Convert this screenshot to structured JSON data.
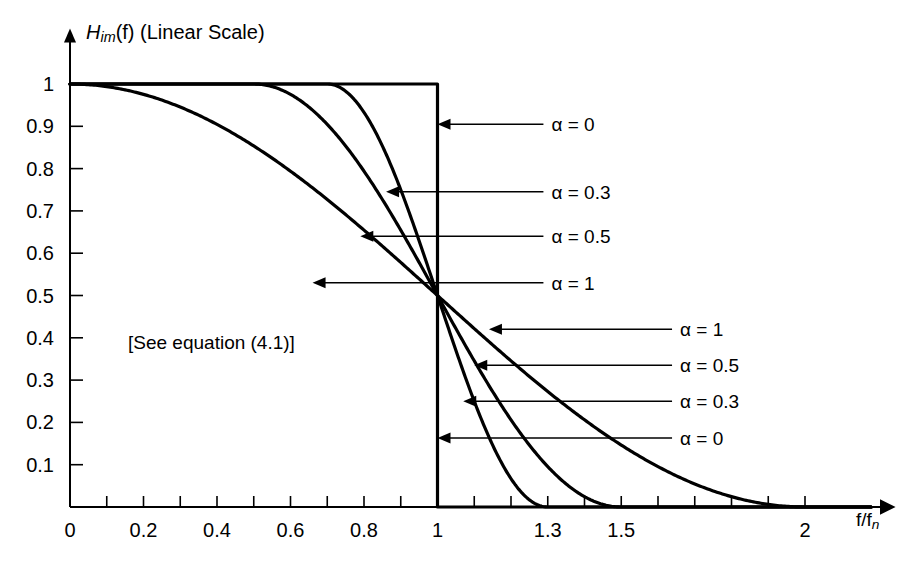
{
  "chart_data": {
    "type": "line",
    "title": "",
    "ylabel": "H_im(f) (Linear Scale)",
    "xlabel": "f/f_n",
    "xlim": [
      0,
      2.18
    ],
    "ylim": [
      0,
      1.06
    ],
    "grid": false,
    "legend_position": "inline-annotations",
    "annotation": "[See equation (4.1)]",
    "x_ticks_major": [
      0,
      0.2,
      0.4,
      0.6,
      0.8,
      1,
      1.3,
      1.5,
      2
    ],
    "x_tick_labels": [
      "0",
      "0.2",
      "0.4",
      "0.6",
      "0.8",
      "1",
      "1.3",
      "1.5",
      "2"
    ],
    "x_ticks_minor": [
      0.1,
      0.3,
      0.5,
      0.7,
      0.9,
      1.1,
      1.2,
      1.4,
      1.6,
      1.7,
      1.8,
      1.9
    ],
    "y_ticks": [
      0.1,
      0.2,
      0.3,
      0.4,
      0.5,
      0.6,
      0.7,
      0.8,
      0.9,
      1
    ],
    "y_tick_labels": [
      "0.1",
      "0.2",
      "0.3",
      "0.4",
      "0.5",
      "0.6",
      "0.7",
      "0.8",
      "0.9",
      "1"
    ],
    "crossing_point": [
      1,
      0.5
    ],
    "series": [
      {
        "name": "alpha = 0",
        "alpha": 0,
        "color": "#000000",
        "points": [
          [
            0,
            1
          ],
          [
            0.2,
            1
          ],
          [
            0.4,
            1
          ],
          [
            0.6,
            1
          ],
          [
            0.8,
            1
          ],
          [
            0.95,
            1
          ],
          [
            0.999,
            1
          ],
          [
            1,
            0.5
          ],
          [
            1.001,
            0
          ],
          [
            1.2,
            0
          ],
          [
            1.6,
            0
          ],
          [
            2,
            0
          ]
        ]
      },
      {
        "name": "alpha = 0.3",
        "alpha": 0.3,
        "color": "#000000",
        "points": [
          [
            0,
            1
          ],
          [
            0.3,
            1
          ],
          [
            0.5,
            1
          ],
          [
            0.65,
            1
          ],
          [
            0.7,
            1
          ],
          [
            0.75,
            0.983
          ],
          [
            0.8,
            0.9045
          ],
          [
            0.85,
            0.75
          ],
          [
            0.9,
            0.567
          ],
          [
            0.95,
            0.4131
          ],
          [
            1,
            0.5
          ],
          [
            1,
            0.5
          ],
          [
            1.05,
            0.25
          ],
          [
            1.1,
            0.0955
          ],
          [
            1.15,
            0.017
          ],
          [
            1.2,
            0.0017
          ],
          [
            1.25,
            0.0001
          ],
          [
            1.3,
            0
          ],
          [
            1.6,
            0
          ],
          [
            2,
            0
          ]
        ]
      },
      {
        "name": "alpha = 0.5",
        "alpha": 0.5,
        "color": "#000000",
        "points": [
          [
            0,
            1
          ],
          [
            0.3,
            1
          ],
          [
            0.45,
            1
          ],
          [
            0.5,
            1
          ],
          [
            0.55,
            0.9755
          ],
          [
            0.6,
            0.9045
          ],
          [
            0.65,
            0.7939
          ],
          [
            0.7,
            0.6545
          ],
          [
            0.75,
            0.5
          ],
          [
            0.8,
            0.3455
          ],
          [
            0.85,
            0.2061
          ],
          [
            0.9,
            0.0955
          ],
          [
            0.95,
            0.0245
          ],
          [
            1,
            0.5
          ],
          [
            1.05,
            0.0245
          ],
          [
            1.1,
            0.0955
          ],
          [
            1.2,
            0.2061
          ],
          [
            1.3,
            0.0955
          ],
          [
            1.4,
            0.0245
          ],
          [
            1.5,
            0
          ],
          [
            1.8,
            0
          ],
          [
            2,
            0
          ]
        ]
      },
      {
        "name": "alpha = 1",
        "alpha": 1,
        "color": "#000000",
        "points": [
          [
            0,
            1
          ],
          [
            0.1,
            0.9755
          ],
          [
            0.2,
            0.9045
          ],
          [
            0.3,
            0.7939
          ],
          [
            0.4,
            0.6545
          ],
          [
            0.5,
            0.5
          ],
          [
            0.6,
            0.3455
          ],
          [
            0.7,
            0.2061
          ],
          [
            0.8,
            0.0955
          ],
          [
            0.9,
            0.0245
          ],
          [
            1,
            0.5
          ],
          [
            1.2,
            0.2061
          ],
          [
            1.4,
            0.0955
          ],
          [
            1.6,
            0.0245
          ],
          [
            1.8,
            0.0061
          ],
          [
            2,
            0
          ]
        ]
      }
    ],
    "callouts_upper": [
      {
        "label": "α = 0",
        "target_x": 1.0,
        "target_y": 0.905,
        "text_x": 1.31,
        "text_y": 0.905
      },
      {
        "label": "α = 0.3",
        "target_x": 0.86,
        "target_y": 0.745,
        "text_x": 1.31,
        "text_y": 0.745
      },
      {
        "label": "α = 0.5",
        "target_x": 0.79,
        "target_y": 0.64,
        "text_x": 1.31,
        "text_y": 0.64
      },
      {
        "label": "α = 1",
        "target_x": 0.66,
        "target_y": 0.53,
        "text_x": 1.31,
        "text_y": 0.53
      }
    ],
    "callouts_lower": [
      {
        "label": "α = 1",
        "target_x": 1.14,
        "target_y": 0.42,
        "text_x": 1.66,
        "text_y": 0.42
      },
      {
        "label": "α = 0.5",
        "target_x": 1.1,
        "target_y": 0.335,
        "text_x": 1.66,
        "text_y": 0.335
      },
      {
        "label": "α = 0.3",
        "target_x": 1.07,
        "target_y": 0.25,
        "text_x": 1.66,
        "text_y": 0.25
      },
      {
        "label": "α = 0",
        "target_x": 1.0,
        "target_y": 0.163,
        "text_x": 1.66,
        "text_y": 0.163
      }
    ]
  },
  "figure": {
    "y_axis_title_main": "H",
    "y_axis_title_sub": "im",
    "y_axis_title_rest": "(f) (Linear Scale)",
    "x_axis_title_main": "f/f",
    "x_axis_title_sub": "n",
    "note": "[See equation (4.1)]"
  }
}
